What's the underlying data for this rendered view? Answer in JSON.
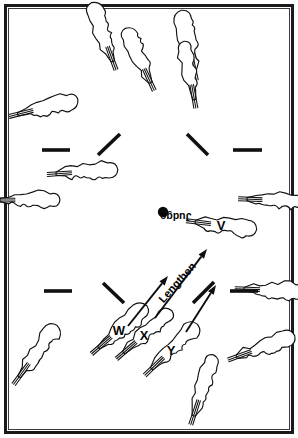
{
  "figure": {
    "background_color": "#ffffff",
    "ink_color": "#101010",
    "width": 298,
    "height": 438
  },
  "frame": {
    "outer_border_color": "#1a1a1a",
    "inner_border_color": "#3a3a3a"
  },
  "labels": {
    "judge": "Judge",
    "lengthen": "Lengthen",
    "boat_v": "V",
    "boat_w": "W",
    "boat_x": "X",
    "boat_y": "Y"
  },
  "judge_marker": {
    "label": "Judge",
    "x": 163,
    "y": 212,
    "radius": 5.2,
    "text_rotation_deg": 180
  },
  "lengthen_annotation": {
    "label": "Lengthen",
    "x": 180,
    "y": 285,
    "rotation_deg": -48
  },
  "arrows": [
    {
      "name": "arrow-w",
      "x1": 128,
      "y1": 326,
      "x2": 168,
      "y2": 276
    },
    {
      "name": "arrow-x",
      "x1": 155,
      "y1": 318,
      "x2": 207,
      "y2": 249
    },
    {
      "name": "arrow-y",
      "x1": 186,
      "y1": 332,
      "x2": 216,
      "y2": 285
    }
  ],
  "dash_marks": [
    {
      "name": "dash-left-upper",
      "x1": 42,
      "y1": 150,
      "x2": 70,
      "y2": 150
    },
    {
      "name": "dash-left-diag",
      "x1": 98,
      "y1": 155,
      "x2": 120,
      "y2": 134
    },
    {
      "name": "dash-right-diag",
      "x1": 187,
      "y1": 134,
      "x2": 208,
      "y2": 155
    },
    {
      "name": "dash-right-upper",
      "x1": 233,
      "y1": 150,
      "x2": 262,
      "y2": 150
    },
    {
      "name": "dash-left-lower",
      "x1": 44,
      "y1": 291,
      "x2": 72,
      "y2": 291
    },
    {
      "name": "dash-left-lowdiag",
      "x1": 103,
      "y1": 283,
      "x2": 124,
      "y2": 303
    },
    {
      "name": "dash-right-lowdiag",
      "x1": 193,
      "y1": 303,
      "x2": 214,
      "y2": 282
    },
    {
      "name": "dash-right-lower",
      "x1": 230,
      "y1": 291,
      "x2": 258,
      "y2": 291
    }
  ],
  "boats": [
    {
      "name": "boat-top-1",
      "cx": 104,
      "cy": 37,
      "angle": -20,
      "len": 52,
      "w": 17,
      "label": ""
    },
    {
      "name": "boat-top-2",
      "cx": 140,
      "cy": 60,
      "angle": -25,
      "len": 50,
      "w": 16,
      "label": ""
    },
    {
      "name": "boat-top-3",
      "cx": 189,
      "cy": 46,
      "angle": -12,
      "len": 52,
      "w": 17,
      "label": ""
    },
    {
      "name": "boat-top-4",
      "cx": 190,
      "cy": 75,
      "angle": -10,
      "len": 50,
      "w": 15,
      "label": ""
    },
    {
      "name": "boat-left-1",
      "cx": 43,
      "cy": 108,
      "angle": 76,
      "len": 52,
      "w": 16,
      "label": ""
    },
    {
      "name": "boat-left-2",
      "cx": 82,
      "cy": 172,
      "angle": 86,
      "len": 52,
      "w": 16,
      "label": ""
    },
    {
      "name": "boat-left-3",
      "cx": 25,
      "cy": 200,
      "angle": 90,
      "len": 50,
      "w": 16,
      "label": ""
    },
    {
      "name": "boat-left-4",
      "cx": 35,
      "cy": 355,
      "angle": 36,
      "len": 54,
      "w": 16,
      "label": ""
    },
    {
      "name": "boat-right-1",
      "cx": 272,
      "cy": 200,
      "angle": 92,
      "len": 50,
      "w": 15,
      "label": ""
    },
    {
      "name": "boat-right-2",
      "cx": 270,
      "cy": 290,
      "angle": 92,
      "len": 52,
      "w": 16,
      "label": ""
    },
    {
      "name": "boat-right-3",
      "cx": 261,
      "cy": 348,
      "angle": 70,
      "len": 52,
      "w": 16,
      "label": ""
    },
    {
      "name": "boat-bottom-1",
      "cx": 202,
      "cy": 390,
      "angle": 18,
      "len": 54,
      "w": 16,
      "label": ""
    },
    {
      "name": "boat-v",
      "cx": 221,
      "cy": 225,
      "angle": 97,
      "len": 52,
      "w": 16,
      "label": "V"
    },
    {
      "name": "boat-w",
      "cx": 119,
      "cy": 330,
      "angle": 49,
      "len": 54,
      "w": 16,
      "label": "W"
    },
    {
      "name": "boat-x",
      "cx": 144,
      "cy": 335,
      "angle": 49,
      "len": 54,
      "w": 16,
      "label": "X"
    },
    {
      "name": "boat-y",
      "cx": 171,
      "cy": 350,
      "angle": 46,
      "len": 54,
      "w": 16,
      "label": "Y"
    }
  ]
}
